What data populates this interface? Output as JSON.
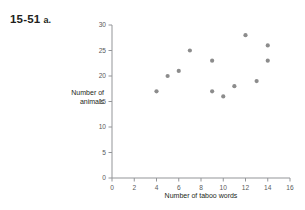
{
  "problem": {
    "number": "15-51",
    "part": "a."
  },
  "chart_data": {
    "type": "scatter",
    "title": "",
    "xlabel": "Number of taboo words",
    "ylabel": "Number of\nanimals",
    "ylabel_line1": "Number of",
    "ylabel_line2": "animals",
    "xlim": [
      0,
      16
    ],
    "ylim": [
      0,
      30
    ],
    "xticks": [
      0,
      2,
      4,
      6,
      8,
      10,
      12,
      14,
      16
    ],
    "yticks": [
      0,
      5,
      10,
      15,
      20,
      25,
      30
    ],
    "xtick_labels": [
      "0",
      "2",
      "4",
      "6",
      "8",
      "10",
      "12",
      "14",
      "16"
    ],
    "ytick_labels": [
      "0",
      "5",
      "10",
      "15",
      "20",
      "25",
      "30"
    ],
    "grid": false,
    "legend": null,
    "marker_color": "#8c8c8c",
    "axis_color": "#939598",
    "x": [
      4,
      5,
      6,
      7,
      9,
      9,
      10,
      11,
      12,
      13,
      14,
      14
    ],
    "y": [
      17,
      20,
      21,
      25,
      23,
      17,
      16,
      18,
      28,
      19,
      26,
      23
    ],
    "points": [
      {
        "x": 4,
        "y": 17
      },
      {
        "x": 5,
        "y": 20
      },
      {
        "x": 6,
        "y": 21
      },
      {
        "x": 7,
        "y": 25
      },
      {
        "x": 9,
        "y": 23
      },
      {
        "x": 9,
        "y": 17
      },
      {
        "x": 10,
        "y": 16
      },
      {
        "x": 11,
        "y": 18
      },
      {
        "x": 12,
        "y": 28
      },
      {
        "x": 13,
        "y": 19
      },
      {
        "x": 14,
        "y": 26
      },
      {
        "x": 14,
        "y": 23
      }
    ]
  }
}
